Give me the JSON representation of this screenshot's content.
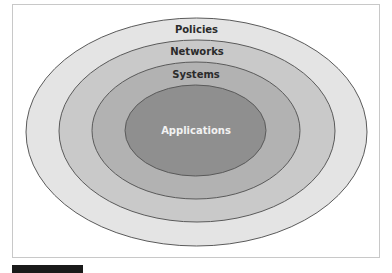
{
  "diagram": {
    "type": "concentric-ellipses",
    "layers": [
      {
        "label": "Policies",
        "fill": "#e4e4e4",
        "text_color": "#2b2b2b",
        "cx": 196.5,
        "cy": 132,
        "rx": 170.5,
        "ry": 114,
        "label_x": 196.5,
        "label_y": 33
      },
      {
        "label": "Networks",
        "fill": "#c9c9c9",
        "text_color": "#2b2b2b",
        "cx": 197,
        "cy": 131,
        "rx": 138,
        "ry": 91,
        "label_x": 197,
        "label_y": 55
      },
      {
        "label": "Systems",
        "fill": "#b2b2b2",
        "text_color": "#2b2b2b",
        "cx": 196,
        "cy": 130.5,
        "rx": 104,
        "ry": 68.5,
        "label_x": 196,
        "label_y": 78
      },
      {
        "label": "Applications",
        "fill": "#8f8f8f",
        "text_color": "#f2f2f2",
        "cx": 195.5,
        "cy": 130.5,
        "rx": 70.5,
        "ry": 45.5,
        "label_x": 196,
        "label_y": 134
      }
    ],
    "stroke_color": "#5a5a5a",
    "frame_border_color": "#c8c8c8"
  }
}
